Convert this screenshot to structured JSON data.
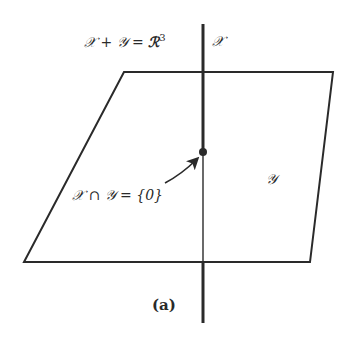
{
  "figure": {
    "caption": "(a)",
    "labels": {
      "sum_lhs": "𝒳 + 𝒴 = ",
      "sum_rhs": "ℛ",
      "sum_exp": "3",
      "line": "𝒳",
      "plane": "𝒴",
      "intersection": "𝒳 ∩ 𝒴 = {0}"
    },
    "plane_corners": {
      "top_left": [
        124,
        72
      ],
      "top_right": [
        333,
        72
      ],
      "bottom_right": [
        310,
        262
      ],
      "bottom_left": [
        24,
        262
      ]
    },
    "line": {
      "x": 203,
      "y_top": 24,
      "y_bottom": 323
    },
    "origin_point": [
      203,
      152
    ],
    "arrow": {
      "from": [
        165,
        183
      ],
      "to": [
        198,
        158
      ]
    },
    "colors": {
      "ink": "#2a2a2a",
      "background": "#ffffff"
    }
  }
}
